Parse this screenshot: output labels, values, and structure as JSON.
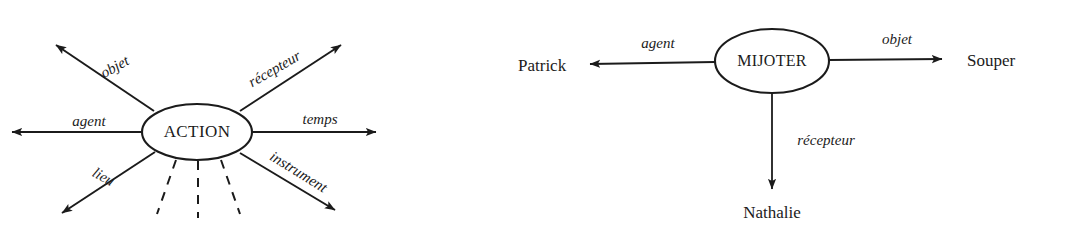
{
  "figure": {
    "background_color": "#ffffff",
    "ink_color": "#1b1b1b",
    "diagrams": [
      {
        "id": "generic-action-frame",
        "center_node": {
          "label": "ACTION",
          "shape": "ellipse",
          "cx": 197,
          "cy": 132,
          "rx": 55,
          "ry": 28,
          "font_size": 17
        },
        "roles": [
          {
            "name": "objet",
            "label": "objet",
            "angle_deg": -152,
            "arrow": "outward",
            "label_rotation_deg": -29,
            "label_x": 117,
            "label_y": 71,
            "tip_x": 52,
            "tip_y": 42,
            "start_x": 154,
            "start_y": 111
          },
          {
            "name": "recepteur",
            "label": "récepteur",
            "angle_deg": -28,
            "arrow": "outward",
            "label_rotation_deg": -30,
            "label_x": 277,
            "label_y": 73,
            "tip_x": 345,
            "tip_y": 42,
            "start_x": 240,
            "start_y": 111
          },
          {
            "name": "agent",
            "label": "agent",
            "angle_deg": 180,
            "arrow": "outward",
            "label_rotation_deg": 0,
            "label_x": 89,
            "label_y": 126,
            "tip_x": 5,
            "tip_y": 132,
            "start_x": 142,
            "start_y": 132
          },
          {
            "name": "temps",
            "label": "temps",
            "angle_deg": 0,
            "arrow": "outward",
            "label_rotation_deg": 0,
            "label_x": 320,
            "label_y": 124,
            "tip_x": 383,
            "tip_y": 132,
            "start_x": 252,
            "start_y": 132
          },
          {
            "name": "lieu",
            "label": "lieu",
            "angle_deg": 148,
            "arrow": "outward",
            "label_rotation_deg": 30,
            "label_x": 101,
            "label_y": 181,
            "tip_x": 57,
            "tip_y": 218,
            "start_x": 155,
            "start_y": 152
          },
          {
            "name": "instrument",
            "label": "instrument",
            "angle_deg": 32,
            "arrow": "outward",
            "label_rotation_deg": 32,
            "label_x": 296,
            "label_y": 176,
            "tip_x": 340,
            "tip_y": 215,
            "start_x": 240,
            "start_y": 153
          }
        ],
        "unlabelled_slots": [
          {
            "name": "dashed-slot-left",
            "x1": 176,
            "x2": 157,
            "y1": 160,
            "y2": 214
          },
          {
            "name": "dashed-slot-center",
            "x1": 198,
            "x2": 198,
            "y1": 161,
            "y2": 218
          },
          {
            "name": "dashed-slot-right",
            "x1": 221,
            "x2": 240,
            "y1": 160,
            "y2": 214
          }
        ]
      },
      {
        "id": "mijoter-instance",
        "center_node": {
          "label": "MIJOTER",
          "shape": "ellipse",
          "cx": 772,
          "cy": 61,
          "rx": 57,
          "ry": 32,
          "font_size": 16
        },
        "roles": [
          {
            "name": "agent",
            "label": "agent",
            "target": "Patrick",
            "target_x": 518,
            "target_y": 71,
            "label_x": 658,
            "label_y": 48,
            "tip_x": 582,
            "tip_y": 64,
            "start_x": 715,
            "start_y": 62,
            "direction": "left"
          },
          {
            "name": "objet",
            "label": "objet",
            "target": "Souper",
            "target_x": 967,
            "target_y": 66,
            "label_x": 897,
            "label_y": 44,
            "tip_x": 950,
            "tip_y": 59,
            "start_x": 829,
            "start_y": 60,
            "direction": "right"
          },
          {
            "name": "recepteur",
            "label": "récepteur",
            "target": "Nathalie",
            "target_x": 772,
            "target_y": 218,
            "label_x": 826,
            "label_y": 145,
            "tip_x": 772,
            "tip_y": 196,
            "start_x": 772,
            "start_y": 93,
            "direction": "down"
          }
        ]
      }
    ]
  }
}
